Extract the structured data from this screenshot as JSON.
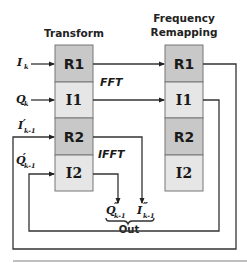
{
  "diagram": {
    "columns": [
      {
        "title_lines": [
          "Transform"
        ],
        "cells": [
          {
            "label": "R1",
            "fill": "#c8c8c8"
          },
          {
            "label": "I1",
            "fill": "#e6e6e6"
          },
          {
            "label": "R2",
            "fill": "#c8c8c8"
          },
          {
            "label": "I2",
            "fill": "#e6e6e6"
          }
        ]
      },
      {
        "title_lines": [
          "Frequency",
          "Remapping"
        ],
        "cells": [
          {
            "label": "R1",
            "fill": "#c8c8c8"
          },
          {
            "label": "I1",
            "fill": "#e6e6e6"
          },
          {
            "label": "R2",
            "fill": "#c8c8c8"
          },
          {
            "label": "I2",
            "fill": "#e6e6e6"
          }
        ]
      }
    ],
    "operations": {
      "fft": "FFT",
      "ifft": "IFFT"
    },
    "inputs": [
      {
        "symbol": "I",
        "prime": "",
        "subscript": "k"
      },
      {
        "symbol": "Q",
        "prime": "",
        "subscript": "k"
      },
      {
        "symbol": "I",
        "prime": "′",
        "subscript": "k-1"
      },
      {
        "symbol": "Q",
        "prime": "′",
        "subscript": "k-1"
      }
    ],
    "outputs": [
      {
        "symbol": "Q",
        "prime": "″",
        "subscript": "k-1"
      },
      {
        "symbol": "I",
        "prime": "″",
        "subscript": "k-1"
      }
    ],
    "output_label": "Out",
    "colors": {
      "line": "#333333",
      "dark_cell": "#c8c8c8",
      "light_cell": "#e6e6e6",
      "cell_border": "#777777",
      "rule": "#aaaaaa"
    }
  }
}
